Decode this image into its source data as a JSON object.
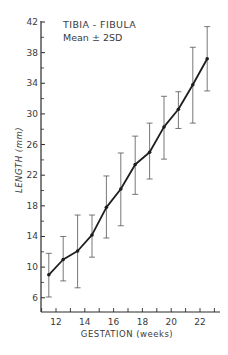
{
  "chart_data": {
    "type": "line",
    "title": "TIBIA - FIBULA",
    "subtitle": "Mean ± 2SD",
    "xlabel": "GESTATION (weeks)",
    "ylabel": "LENGTH (mm)",
    "xlim": [
      10.9,
      23.2
    ],
    "ylim": [
      4,
      42
    ],
    "x_ticks": [
      12,
      14,
      16,
      18,
      20,
      22
    ],
    "x_minor_ticks": [
      11,
      12,
      13,
      14,
      15,
      16,
      17,
      18,
      19,
      20,
      21,
      22,
      23
    ],
    "y_ticks": [
      6,
      10,
      14,
      18,
      22,
      26,
      30,
      34,
      38,
      42
    ],
    "y_minor_ticks": [
      8,
      12,
      16,
      20,
      24,
      28,
      32,
      36,
      40
    ],
    "grid": false,
    "legend": "none",
    "series": [
      {
        "name": "Mean",
        "x": [
          11.5,
          12.5,
          13.5,
          14.5,
          15.5,
          16.5,
          17.5,
          18.5,
          19.5,
          20.5,
          21.5,
          22.5
        ],
        "values": [
          9.0,
          11.0,
          12.1,
          14.2,
          17.8,
          20.2,
          23.4,
          25.0,
          28.3,
          30.6,
          33.8,
          37.2
        ],
        "upper_2sd": [
          11.8,
          14.0,
          16.8,
          16.8,
          21.9,
          24.9,
          27.1,
          28.8,
          32.3,
          32.9,
          38.7,
          41.4
        ],
        "lower_2sd": [
          6.1,
          8.2,
          7.3,
          11.3,
          13.8,
          15.4,
          19.5,
          21.5,
          24.1,
          28.1,
          28.8,
          33.0
        ]
      }
    ]
  },
  "colors": {
    "ink": "#2a2a2a",
    "background": "#ffffff"
  }
}
